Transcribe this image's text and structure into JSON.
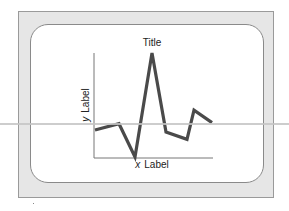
{
  "chart_data": {
    "type": "line",
    "title": "Title",
    "xlabel": "x Label",
    "ylabel": "y Label",
    "xlabel_var": "x",
    "xlabel_text": "Label",
    "ylabel_var": "y",
    "ylabel_text": "Label",
    "x": [
      0,
      1,
      2,
      3,
      4,
      5,
      6,
      7
    ],
    "series": [
      {
        "name": "series",
        "values": [
          2.6,
          3.2,
          0.0,
          10.0,
          2.4,
          1.7,
          4.5,
          3.3
        ]
      }
    ],
    "xlim": [
      0,
      7
    ],
    "ylim": [
      0,
      10
    ],
    "grid": false,
    "ticks": false,
    "legend": "none",
    "line_color": "#4a4a4a"
  }
}
